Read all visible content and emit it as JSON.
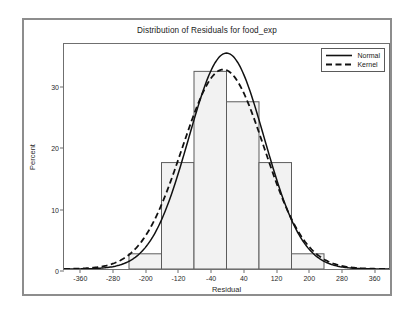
{
  "chart_data": {
    "type": "bar",
    "title": "Distribution of Residuals for food_exp",
    "xlabel": "Residual",
    "ylabel": "Percent",
    "xlim": [
      -400,
      400
    ],
    "ylim": [
      0,
      37
    ],
    "grid": false,
    "legend_position": "top-right",
    "xticks": [
      "-360",
      "-280",
      "-200",
      "-120",
      "-40",
      "40",
      "120",
      "200",
      "280",
      "360"
    ],
    "xtick_values": [
      -360,
      -280,
      -200,
      -120,
      -40,
      40,
      120,
      200,
      280,
      360
    ],
    "yticks": [
      "0",
      "10",
      "20",
      "30"
    ],
    "ytick_values": [
      0,
      10,
      20,
      30
    ],
    "bin_width": 80,
    "bins": [
      {
        "left": -240,
        "right": -160,
        "center": -200,
        "value": 2.5
      },
      {
        "left": -160,
        "right": -80,
        "center": -120,
        "value": 17.5
      },
      {
        "left": -80,
        "right": 0,
        "center": -40,
        "value": 32.5
      },
      {
        "left": 0,
        "right": 80,
        "center": 40,
        "value": 27.5
      },
      {
        "left": 80,
        "right": 160,
        "center": 120,
        "value": 17.5
      },
      {
        "left": 160,
        "right": 240,
        "center": 200,
        "value": 2.5
      }
    ],
    "categories": [
      "-200",
      "-120",
      "-40",
      "40",
      "120",
      "200"
    ],
    "values": [
      2.5,
      17.5,
      32.5,
      27.5,
      17.5,
      2.5
    ],
    "series": [
      {
        "name": "Normal",
        "style": "solid",
        "type": "line",
        "peak_x": 0,
        "peak_y": 35.5,
        "mean": 0,
        "std": 93,
        "scale": 35.5
      },
      {
        "name": "Kernel",
        "style": "dashed",
        "type": "line",
        "peak_x": -8,
        "peak_y": 32.8,
        "mean": -8,
        "std": 101,
        "scale": 32.8
      }
    ],
    "legend": [
      {
        "label": "Normal",
        "style": "solid"
      },
      {
        "label": "Kernel",
        "style": "dashed"
      }
    ],
    "colors": {
      "bar_fill": "#f2f2f2",
      "bar_stroke": "#5c5c5c",
      "curve": "#111111",
      "axis": "#6f6f6f",
      "frame": "#8d8d8d",
      "text": "#1b1b1b"
    }
  }
}
